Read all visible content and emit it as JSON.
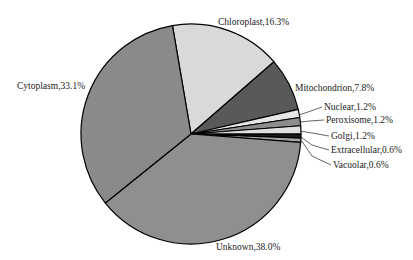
{
  "chart_data": {
    "type": "pie",
    "title": "",
    "start_angle_deg": -99.7,
    "direction": "clockwise",
    "slices": [
      {
        "label": "Chloroplast",
        "value": 16.3,
        "text": "Chloroplast,16.3%",
        "color": "#d9d9d9"
      },
      {
        "label": "Mitochondrion",
        "value": 7.8,
        "text": "Mitochondrion,7.8%",
        "color": "#595959"
      },
      {
        "label": "Nuclear",
        "value": 1.2,
        "text": "Nuclear,1.2%",
        "color": "#e6e6e6"
      },
      {
        "label": "Peroxisome",
        "value": 1.2,
        "text": "Peroxisome,1.2%",
        "color": "#8c8c8c"
      },
      {
        "label": "Golgi",
        "value": 1.2,
        "text": "Golgi,1.2%",
        "color": "#e0e0e0"
      },
      {
        "label": "Extracellular",
        "value": 0.6,
        "text": "Extracellular,0.6%",
        "color": "#1a1a1a"
      },
      {
        "label": "Vacuolar",
        "value": 0.6,
        "text": "Vacuolar,0.6%",
        "color": "#a6a6a6"
      },
      {
        "label": "Unknown",
        "value": 38.0,
        "text": "Unknown,38.0%",
        "color": "#8f8f8f"
      },
      {
        "label": "Cytoplasm",
        "value": 33.1,
        "text": "Cytoplasm,33.1%",
        "color": "#8a8a8a"
      }
    ],
    "labels": {
      "Chloroplast": {
        "x": 218,
        "y": 25,
        "anchor": "start"
      },
      "Mitochondrion": {
        "x": 295,
        "y": 91,
        "anchor": "start"
      },
      "Nuclear": {
        "x": 324,
        "y": 110,
        "anchor": "start"
      },
      "Peroxisome": {
        "x": 326,
        "y": 123,
        "anchor": "start"
      },
      "Golgi": {
        "x": 331,
        "y": 139,
        "anchor": "start"
      },
      "Extracellular": {
        "x": 331,
        "y": 153,
        "anchor": "start"
      },
      "Vacuolar": {
        "x": 333,
        "y": 168,
        "anchor": "start"
      },
      "Unknown": {
        "x": 216,
        "y": 250,
        "anchor": "start"
      },
      "Cytoplasm": {
        "x": 17,
        "y": 89,
        "anchor": "start"
      }
    },
    "leaders": {
      "Nuclear": [
        [
          299,
          115
        ],
        [
          308,
          112
        ],
        [
          322,
          107
        ]
      ],
      "Peroxisome": [
        [
          300,
          122
        ],
        [
          310,
          121
        ],
        [
          324,
          120
        ]
      ],
      "Golgi": [
        [
          300,
          131
        ],
        [
          312,
          133
        ],
        [
          329,
          136
        ]
      ],
      "Extracellular": [
        [
          301,
          137
        ],
        [
          312,
          145
        ],
        [
          329,
          150
        ]
      ],
      "Vacuolar": [
        [
          301,
          140
        ],
        [
          312,
          156
        ],
        [
          331,
          165
        ]
      ]
    },
    "center": [
      191,
      134
    ],
    "radius": 110,
    "legend": "none"
  }
}
